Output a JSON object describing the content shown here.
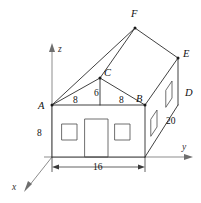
{
  "figure": {
    "background_color": "#ffffff",
    "line_color": "#2b2b2b",
    "axis_color": "#8d8d8d"
  },
  "axes": {
    "x_label": "x",
    "y_label": "y",
    "z_label": "z",
    "origin_label": ""
  },
  "vertices": [
    {
      "name": "A",
      "label": "A"
    },
    {
      "name": "B",
      "label": "B"
    },
    {
      "name": "C",
      "label": "C"
    },
    {
      "name": "D",
      "label": "D"
    },
    {
      "name": "E",
      "label": "E"
    },
    {
      "name": "F",
      "label": "F"
    }
  ],
  "dimensions": [
    {
      "name": "wall-height",
      "label": "8"
    },
    {
      "name": "half-width-left",
      "label": "8"
    },
    {
      "name": "half-width-right",
      "label": "8"
    },
    {
      "name": "gable-height",
      "label": "6"
    },
    {
      "name": "depth",
      "label": "20"
    },
    {
      "name": "front-width",
      "label": "16"
    }
  ],
  "features": [
    {
      "name": "front-window-left"
    },
    {
      "name": "front-door"
    },
    {
      "name": "front-window-right"
    },
    {
      "name": "side-window-lower"
    },
    {
      "name": "side-window-upper"
    }
  ]
}
